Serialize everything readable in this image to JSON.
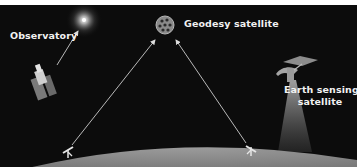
{
  "diagram": {
    "title": "",
    "background_color": "#0c0c0c",
    "earth_color": "#8e8e8e",
    "labels": {
      "observatory": "Observatory",
      "geodesy_satellite": "Geodesy satellite",
      "earth_sensing_line1": "Earth sensing",
      "earth_sensing_line2": "satellite"
    },
    "nodes": [
      {
        "id": "radio-source",
        "icon": "glowing-star-icon",
        "x": 84,
        "y": 20
      },
      {
        "id": "observatory",
        "icon": "radio-telescope-icon",
        "x": 42,
        "y": 78
      },
      {
        "id": "geodesy-satellite",
        "icon": "laser-reflector-sphere-icon",
        "x": 165,
        "y": 25
      },
      {
        "id": "earth-sensing-satellite",
        "icon": "satellite-icon",
        "x": 300,
        "y": 72
      },
      {
        "id": "ground-station-left",
        "icon": "ground-station-icon",
        "x": 68,
        "y": 152
      },
      {
        "id": "ground-station-right",
        "icon": "ground-station-icon",
        "x": 252,
        "y": 152
      }
    ],
    "connections": [
      {
        "from": "observatory",
        "to": "radio-source",
        "type": "arrow"
      },
      {
        "from": "ground-station-left",
        "to": "geodesy-satellite",
        "type": "arrow"
      },
      {
        "from": "ground-station-right",
        "to": "geodesy-satellite",
        "type": "arrow"
      },
      {
        "from": "earth-sensing-satellite",
        "to": "earth",
        "type": "beam"
      }
    ]
  }
}
